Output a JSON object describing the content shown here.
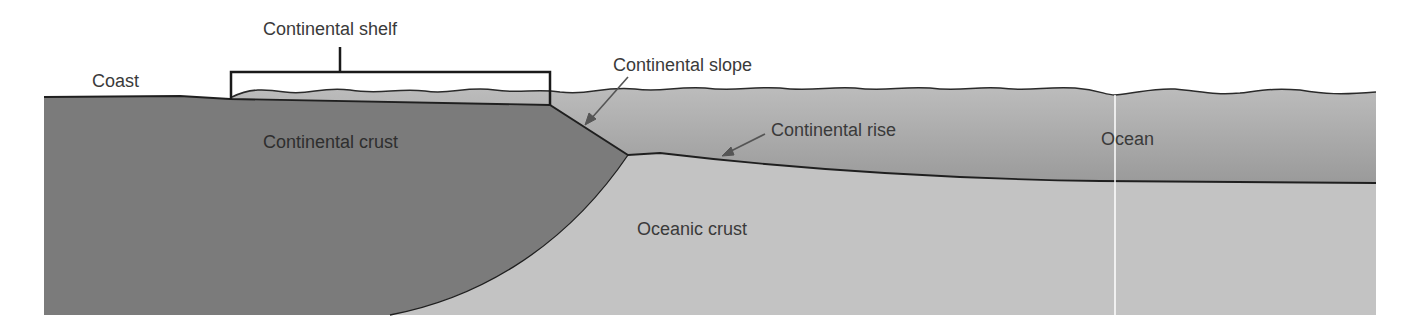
{
  "diagram": {
    "type": "cross-section",
    "labels": {
      "coast": "Coast",
      "continental_shelf": "Continental shelf",
      "continental_slope": "Continental slope",
      "continental_rise": "Continental rise",
      "continental_crust": "Continental crust",
      "oceanic_crust": "Oceanic crust",
      "ocean": "Ocean"
    },
    "colors": {
      "continental_crust": "#7d7d7d",
      "ocean_water_top": "#b9b9b9",
      "ocean_water_bottom": "#9c9c9c",
      "oceanic_crust": "#c4c4c4",
      "outline": "#1f1f1f",
      "arrow": "#555555",
      "label_text": "#3a3a3a",
      "background": "#ffffff"
    }
  }
}
